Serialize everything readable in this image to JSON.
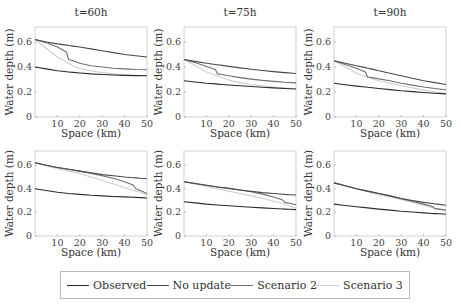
{
  "chart_data": [
    {
      "type": "line",
      "title": "t=60h",
      "row": 0,
      "col": 0,
      "xlabel": "Space (km)",
      "ylabel": "Water depth (m)",
      "xlim": [
        0,
        50
      ],
      "ylim": [
        0,
        0.72
      ],
      "xticks": [
        10,
        20,
        30,
        40,
        50
      ],
      "yticks": [
        0,
        0.2,
        0.4,
        0.6
      ],
      "x": [
        0,
        5,
        10,
        14,
        15,
        17,
        20,
        25,
        30,
        35,
        40,
        45,
        50
      ],
      "series": [
        {
          "name": "Observed",
          "values": [
            0.4,
            0.385,
            0.37,
            0.362,
            0.36,
            0.357,
            0.352,
            0.345,
            0.34,
            0.336,
            0.333,
            0.331,
            0.33
          ]
        },
        {
          "name": "No update",
          "values": [
            0.62,
            0.6,
            0.585,
            0.575,
            0.572,
            0.567,
            0.56,
            0.545,
            0.53,
            0.515,
            0.5,
            0.49,
            0.48
          ]
        },
        {
          "name": "Scenario 2",
          "values": [
            0.62,
            0.595,
            0.56,
            0.52,
            0.46,
            0.45,
            0.43,
            0.41,
            0.4,
            0.39,
            0.385,
            0.38,
            0.378
          ]
        },
        {
          "name": "Scenario 3",
          "values": [
            0.62,
            0.55,
            0.48,
            0.44,
            0.43,
            0.41,
            0.39,
            0.37,
            0.355,
            0.345,
            0.338,
            0.334,
            0.332
          ]
        }
      ]
    },
    {
      "type": "line",
      "title": "t=75h",
      "row": 0,
      "col": 1,
      "xlabel": "Space (km)",
      "ylabel": "Water depth (m)",
      "xlim": [
        0,
        50
      ],
      "ylim": [
        0,
        0.72
      ],
      "xticks": [
        10,
        20,
        30,
        40,
        50
      ],
      "yticks": [
        0,
        0.2,
        0.4,
        0.6
      ],
      "x": [
        0,
        5,
        10,
        14,
        15,
        17,
        20,
        25,
        30,
        35,
        40,
        45,
        50
      ],
      "series": [
        {
          "name": "Observed",
          "values": [
            0.29,
            0.28,
            0.27,
            0.265,
            0.263,
            0.26,
            0.256,
            0.25,
            0.244,
            0.238,
            0.233,
            0.228,
            0.224
          ]
        },
        {
          "name": "No update",
          "values": [
            0.46,
            0.445,
            0.43,
            0.42,
            0.418,
            0.413,
            0.405,
            0.393,
            0.382,
            0.372,
            0.363,
            0.355,
            0.348
          ]
        },
        {
          "name": "Scenario 2",
          "values": [
            0.46,
            0.435,
            0.405,
            0.38,
            0.345,
            0.34,
            0.33,
            0.315,
            0.303,
            0.293,
            0.285,
            0.278,
            0.273
          ]
        },
        {
          "name": "Scenario 3",
          "values": [
            0.46,
            0.41,
            0.36,
            0.335,
            0.33,
            0.315,
            0.295,
            0.275,
            0.26,
            0.25,
            0.24,
            0.232,
            0.226
          ]
        }
      ]
    },
    {
      "type": "line",
      "title": "t=90h",
      "row": 0,
      "col": 2,
      "xlabel": "Space (km)",
      "ylabel": "Water depth (m)",
      "xlim": [
        0,
        50
      ],
      "ylim": [
        0,
        0.72
      ],
      "xticks": [
        10,
        20,
        30,
        40,
        50
      ],
      "yticks": [
        0,
        0.2,
        0.4,
        0.6
      ],
      "x": [
        0,
        5,
        10,
        14,
        15,
        17,
        20,
        25,
        30,
        35,
        40,
        45,
        50
      ],
      "series": [
        {
          "name": "Observed",
          "values": [
            0.27,
            0.258,
            0.247,
            0.24,
            0.238,
            0.234,
            0.228,
            0.219,
            0.21,
            0.203,
            0.196,
            0.19,
            0.185
          ]
        },
        {
          "name": "No update",
          "values": [
            0.45,
            0.43,
            0.41,
            0.395,
            0.39,
            0.383,
            0.37,
            0.35,
            0.33,
            0.31,
            0.29,
            0.275,
            0.26
          ]
        },
        {
          "name": "Scenario 2",
          "values": [
            0.45,
            0.42,
            0.39,
            0.36,
            0.32,
            0.315,
            0.305,
            0.29,
            0.27,
            0.255,
            0.24,
            0.228,
            0.218
          ]
        },
        {
          "name": "Scenario 3",
          "values": [
            0.45,
            0.4,
            0.35,
            0.325,
            0.32,
            0.305,
            0.29,
            0.27,
            0.25,
            0.233,
            0.215,
            0.2,
            0.19
          ]
        }
      ]
    },
    {
      "type": "line",
      "title": "",
      "row": 1,
      "col": 0,
      "xlabel": "Space (km)",
      "ylabel": "Water depth (m)",
      "xlim": [
        0,
        50
      ],
      "ylim": [
        0,
        0.72
      ],
      "xticks": [
        10,
        20,
        30,
        40,
        50
      ],
      "yticks": [
        0,
        0.2,
        0.4,
        0.6
      ],
      "x": [
        0,
        5,
        10,
        15,
        20,
        25,
        30,
        35,
        40,
        44,
        45,
        47,
        50
      ],
      "series": [
        {
          "name": "Observed",
          "values": [
            0.4,
            0.385,
            0.37,
            0.36,
            0.352,
            0.345,
            0.34,
            0.335,
            0.331,
            0.328,
            0.327,
            0.325,
            0.322
          ]
        },
        {
          "name": "No update",
          "values": [
            0.62,
            0.6,
            0.58,
            0.565,
            0.55,
            0.535,
            0.52,
            0.51,
            0.5,
            0.494,
            0.492,
            0.489,
            0.485
          ]
        },
        {
          "name": "Scenario 2",
          "values": [
            0.62,
            0.6,
            0.58,
            0.565,
            0.55,
            0.53,
            0.51,
            0.49,
            0.46,
            0.43,
            0.4,
            0.385,
            0.36
          ]
        },
        {
          "name": "Scenario 3",
          "values": [
            0.62,
            0.595,
            0.57,
            0.55,
            0.53,
            0.5,
            0.47,
            0.44,
            0.41,
            0.385,
            0.38,
            0.37,
            0.35
          ]
        }
      ]
    },
    {
      "type": "line",
      "title": "",
      "row": 1,
      "col": 1,
      "xlabel": "Space (km)",
      "ylabel": "Water depth (m)",
      "xlim": [
        0,
        50
      ],
      "ylim": [
        0,
        0.72
      ],
      "xticks": [
        10,
        20,
        30,
        40,
        50
      ],
      "yticks": [
        0,
        0.2,
        0.4,
        0.6
      ],
      "x": [
        0,
        5,
        10,
        15,
        20,
        25,
        30,
        35,
        40,
        44,
        45,
        47,
        50
      ],
      "series": [
        {
          "name": "Observed",
          "values": [
            0.29,
            0.28,
            0.27,
            0.263,
            0.256,
            0.25,
            0.244,
            0.238,
            0.233,
            0.229,
            0.228,
            0.226,
            0.224
          ]
        },
        {
          "name": "No update",
          "values": [
            0.46,
            0.445,
            0.43,
            0.415,
            0.403,
            0.39,
            0.378,
            0.368,
            0.36,
            0.354,
            0.352,
            0.35,
            0.347
          ]
        },
        {
          "name": "Scenario 2",
          "values": [
            0.46,
            0.445,
            0.43,
            0.415,
            0.403,
            0.39,
            0.375,
            0.355,
            0.33,
            0.305,
            0.285,
            0.278,
            0.265
          ]
        },
        {
          "name": "Scenario 3",
          "values": [
            0.46,
            0.44,
            0.42,
            0.4,
            0.38,
            0.36,
            0.34,
            0.32,
            0.295,
            0.275,
            0.27,
            0.255,
            0.235
          ]
        }
      ]
    },
    {
      "type": "line",
      "title": "",
      "row": 1,
      "col": 2,
      "xlabel": "Space (km)",
      "ylabel": "Water depth (m)",
      "xlim": [
        0,
        50
      ],
      "ylim": [
        0,
        0.72
      ],
      "xticks": [
        10,
        20,
        30,
        40,
        50
      ],
      "yticks": [
        0,
        0.2,
        0.4,
        0.6
      ],
      "x": [
        0,
        5,
        10,
        15,
        20,
        25,
        30,
        35,
        40,
        44,
        45,
        47,
        50
      ],
      "series": [
        {
          "name": "Observed",
          "values": [
            0.27,
            0.258,
            0.247,
            0.238,
            0.228,
            0.219,
            0.21,
            0.203,
            0.196,
            0.191,
            0.19,
            0.188,
            0.185
          ]
        },
        {
          "name": "No update",
          "values": [
            0.45,
            0.425,
            0.4,
            0.38,
            0.36,
            0.34,
            0.318,
            0.3,
            0.285,
            0.275,
            0.272,
            0.268,
            0.26
          ]
        },
        {
          "name": "Scenario 2",
          "values": [
            0.45,
            0.425,
            0.4,
            0.38,
            0.36,
            0.34,
            0.315,
            0.295,
            0.27,
            0.25,
            0.232,
            0.228,
            0.22
          ]
        },
        {
          "name": "Scenario 3",
          "values": [
            0.45,
            0.425,
            0.4,
            0.375,
            0.35,
            0.33,
            0.31,
            0.285,
            0.26,
            0.24,
            0.235,
            0.225,
            0.21
          ]
        }
      ]
    }
  ],
  "series_colors": {
    "Observed": "#2b2b2b",
    "No update": "#4a4a4a",
    "Scenario 2": "#6e6e6e",
    "Scenario 3": "#cfcfcf"
  },
  "legend": {
    "items": [
      {
        "label": "Observed",
        "color": "#2b2b2b"
      },
      {
        "label": "No update",
        "color": "#4a4a4a"
      },
      {
        "label": "Scenario 2",
        "color": "#6e6e6e"
      },
      {
        "label": "Scenario 3",
        "color": "#cfcfcf"
      }
    ]
  }
}
